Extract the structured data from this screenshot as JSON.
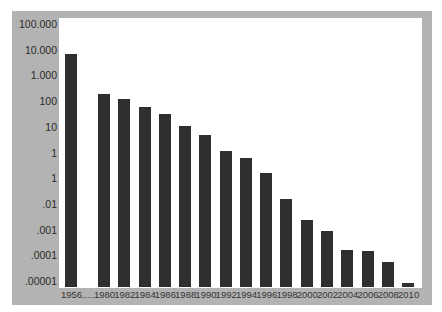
{
  "chart_data": {
    "type": "bar",
    "title": "",
    "xlabel": "",
    "ylabel": "",
    "yscale": "log",
    "ylim": [
      1e-05,
      100000
    ],
    "grid": false,
    "legend": null,
    "y_tick_labels": [
      "100.000",
      "10.000",
      "1.000",
      "100",
      "10",
      "1",
      "1",
      ".01",
      ".001",
      ".0001",
      ".00001"
    ],
    "categories": [
      "1956......",
      "1980",
      "1982",
      "1984",
      "1986",
      "1988",
      "1990",
      "1992",
      "1994",
      "1996",
      "1998",
      "2000",
      "2002",
      "2004",
      "2006",
      "2008",
      "2010"
    ],
    "values": [
      6800,
      190,
      120,
      60,
      32,
      11,
      5,
      1.1,
      0.6,
      0.16,
      0.015,
      0.0023,
      0.0009,
      0.00016,
      0.00015,
      5.5e-05,
      8e-06
    ],
    "colors": {
      "bar": "#2f2f2f",
      "frame": "#b3b3b3",
      "plot_bg": "#ffffff"
    }
  }
}
